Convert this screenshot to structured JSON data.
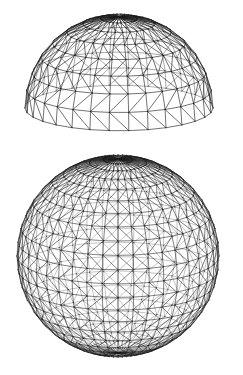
{
  "page": {
    "background_color": "#ffffff",
    "width": 243,
    "height": 375
  },
  "figures": [
    {
      "name": "hemispherical-geodesic-dome",
      "caption": "",
      "shape": "hemisphere",
      "style": "wireframe triangulated lattice",
      "line_color": "#1a1a1a",
      "line_width": 0.55,
      "center_x": 119,
      "center_y": 108,
      "radius_x": 94,
      "radius_y": 94,
      "meridians": 30,
      "rings": 8,
      "tilt_degrees": 14,
      "bbox": {
        "x": 25,
        "y": 12,
        "width": 188,
        "height": 103
      }
    },
    {
      "name": "full-geodesic-sphere",
      "caption": "",
      "shape": "sphere",
      "style": "wireframe triangulated lattice",
      "line_color": "#1a1a1a",
      "line_width": 0.5,
      "center_x": 118,
      "center_y": 108,
      "radius_x": 101,
      "radius_y": 101,
      "meridians": 40,
      "rings": 22,
      "tilt_degrees": 16,
      "bbox": {
        "x": 17,
        "y": 155,
        "width": 201,
        "height": 203
      }
    }
  ],
  "chart_data": {
    "type": "scatter",
    "xlabel": "",
    "ylabel": "",
    "series": [
      {
        "name": "hemispherical dome",
        "description": "Upper figure: hemisphere wireframe, latitude rings crossed by meridians with diagonal bracing producing triangular facets; rim seen slightly from above so the lower edge curves downward at the ends.",
        "meridian_count": 30,
        "ring_count": 8,
        "view_elevation_degrees": 14
      },
      {
        "name": "full sphere",
        "description": "Lower figure: complete sphere wireframe with a denser triangulated lattice; the silhouette reads as a dark beaded circle where edges bunch near the limb.",
        "meridian_count": 40,
        "ring_count": 22,
        "view_elevation_degrees": 16
      }
    ]
  }
}
